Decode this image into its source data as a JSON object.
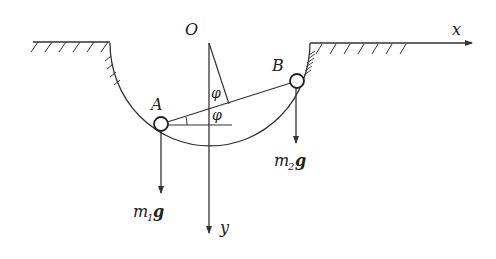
{
  "diagram": {
    "type": "mechanics",
    "labels": {
      "origin": "O",
      "x_axis": "x",
      "y_axis": "y",
      "point_a": "A",
      "point_b": "B",
      "angle_upper": "φ",
      "angle_lower": "φ",
      "weight_a_main": "m",
      "weight_a_sub": "1",
      "weight_a_vec": "g",
      "weight_b_main": "m",
      "weight_b_sub": "2",
      "weight_b_vec": "g"
    },
    "colors": {
      "stroke": "#333333",
      "background": "#ffffff"
    }
  }
}
